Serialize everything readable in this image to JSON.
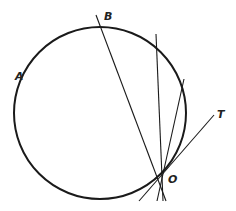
{
  "diagram": {
    "labels": {
      "A": "A",
      "B": "B",
      "O": "O",
      "T": "T"
    },
    "colors": {
      "stroke": "#1a1a1a",
      "background": "#ffffff"
    },
    "circle": {
      "cx": 100,
      "cy": 113,
      "r": 86
    },
    "point_O": {
      "x": 162,
      "y": 171
    },
    "lines": [
      {
        "name": "chord-OB",
        "x1": 96,
        "y1": 15,
        "x2": 166,
        "y2": 201
      },
      {
        "name": "chord-O-steep",
        "x1": 156,
        "y1": 34,
        "x2": 163,
        "y2": 201
      },
      {
        "name": "chord-O-right",
        "x1": 184,
        "y1": 79,
        "x2": 157,
        "y2": 201
      },
      {
        "name": "tangent-OT",
        "x1": 214,
        "y1": 115,
        "x2": 139,
        "y2": 201
      }
    ]
  }
}
